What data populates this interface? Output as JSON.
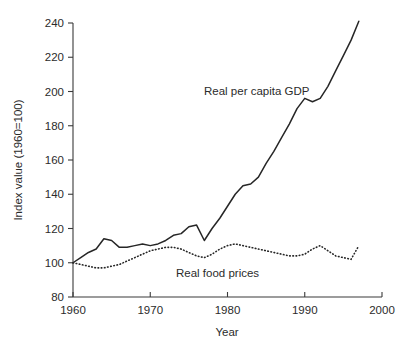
{
  "chart_data": {
    "type": "line",
    "title": "",
    "xlabel": "Year",
    "ylabel": "Index value (1960=100)",
    "xlim": [
      1960,
      2000
    ],
    "ylim": [
      80,
      240
    ],
    "grid": false,
    "legend_position": "inline-annotations",
    "xticks": [
      1960,
      1970,
      1980,
      1990,
      2000
    ],
    "yticks": [
      80,
      100,
      120,
      140,
      160,
      180,
      200,
      220,
      240
    ],
    "x": [
      1960,
      1961,
      1962,
      1963,
      1964,
      1965,
      1966,
      1967,
      1968,
      1969,
      1970,
      1971,
      1972,
      1973,
      1974,
      1975,
      1976,
      1977,
      1978,
      1979,
      1980,
      1981,
      1982,
      1983,
      1984,
      1985,
      1986,
      1987,
      1988,
      1989,
      1990,
      1991,
      1992,
      1993,
      1994,
      1995,
      1996,
      1997
    ],
    "series": [
      {
        "name": "Real per capita GDP",
        "style": "solid",
        "annotation": "Real per capita GDP",
        "values": [
          100,
          103,
          106,
          108,
          114,
          113,
          109,
          109,
          110,
          111,
          110,
          111,
          113,
          116,
          117,
          121,
          122,
          113,
          120,
          126,
          133,
          140,
          145,
          146,
          150,
          158,
          165,
          173,
          181,
          190,
          196,
          194,
          196,
          203,
          212,
          221,
          230,
          241
        ]
      },
      {
        "name": "Real food prices",
        "style": "dotted",
        "annotation": "Real food prices",
        "values": [
          100,
          99,
          98,
          97,
          97,
          98,
          99,
          101,
          103,
          105,
          107,
          108,
          109,
          109,
          108,
          106,
          104,
          103,
          105,
          108,
          110,
          111,
          110,
          109,
          108,
          107,
          106,
          105,
          104,
          104,
          105,
          108,
          110,
          107,
          104,
          103,
          102,
          110
        ]
      }
    ]
  },
  "annotations": {
    "gdp_label": "Real per capita GDP",
    "food_label": "Real food prices"
  },
  "axes": {
    "y_title": "Index value (1960=100)",
    "x_title": "Year",
    "y_tick_labels": [
      "240",
      "220",
      "200",
      "180",
      "160",
      "140",
      "120",
      "100",
      "80"
    ],
    "x_tick_labels": [
      "1960",
      "1970",
      "1980",
      "1990",
      "2000"
    ]
  },
  "colors": {
    "line": "#262626",
    "axis": "#3a3a3a",
    "background": "#ffffff",
    "text": "#2b2b2b"
  }
}
